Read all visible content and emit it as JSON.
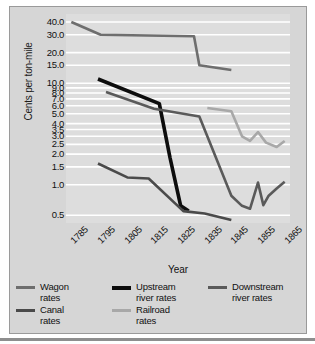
{
  "chart_data": {
    "type": "line",
    "title": "",
    "xlabel": "Year",
    "ylabel": "Cents per ton-mile",
    "yscale": "log",
    "ylim": [
      0.42,
      48
    ],
    "xlim": [
      1783,
      1867
    ],
    "grid": true,
    "grid_color": "#ffffff",
    "background": "#dddddd",
    "legend_position": "below",
    "x_ticks": [
      "1785",
      "1795",
      "1805",
      "1815",
      "1825",
      "1835",
      "1845",
      "1855",
      "1865"
    ],
    "y_ticks": [
      "40.0",
      "30.0",
      "20.0",
      "15.0",
      "10.0",
      "9.0",
      "8.0",
      "7.0",
      "6.0",
      "5.0",
      "4.0",
      "3.5",
      "3.0",
      "2.5",
      "2.0",
      "1.5",
      "1.0",
      "0.5"
    ],
    "y_tick_values": [
      40,
      30,
      20,
      15,
      10,
      9,
      8,
      7,
      6,
      5,
      4,
      3.5,
      3,
      2.5,
      2,
      1.5,
      1,
      0.5
    ],
    "series": [
      {
        "name": "Wagon rates",
        "color": "#6e6e6e",
        "width": 2.6,
        "x": [
          1785,
          1796,
          1831,
          1833,
          1845
        ],
        "values": [
          40.0,
          30.0,
          29.0,
          15.0,
          13.5
        ]
      },
      {
        "name": "Upstream river rates",
        "color": "#0d0d0d",
        "width": 3.6,
        "x": [
          1795,
          1818,
          1822,
          1826,
          1829
        ],
        "values": [
          11.0,
          6.3,
          1.85,
          0.62,
          0.55
        ]
      },
      {
        "name": "Downstream river rates",
        "color": "#5a5a5a",
        "width": 2.6,
        "x": [
          1798,
          1816,
          1833,
          1845,
          1849,
          1852,
          1855,
          1857,
          1859,
          1862,
          1865
        ],
        "values": [
          8.2,
          5.6,
          4.7,
          0.78,
          0.62,
          0.58,
          1.05,
          0.63,
          0.78,
          0.92,
          1.07
        ]
      },
      {
        "name": "Canal rates",
        "color": "#4a4a4a",
        "width": 2.6,
        "x": [
          1795,
          1806,
          1814,
          1827,
          1835,
          1845
        ],
        "values": [
          1.62,
          1.18,
          1.15,
          0.55,
          0.52,
          0.45
        ]
      },
      {
        "name": "Railroad rates",
        "color": "#a8a8a8",
        "width": 2.6,
        "x": [
          1836,
          1845,
          1849,
          1852,
          1855,
          1858,
          1862,
          1865
        ],
        "values": [
          5.7,
          5.3,
          3.0,
          2.7,
          3.3,
          2.6,
          2.35,
          2.7
        ]
      }
    ]
  },
  "legend": {
    "items": [
      {
        "label_line1": "Wagon",
        "label_line2": "rates",
        "color": "#6e6e6e",
        "thick": false
      },
      {
        "label_line1": "Upstream",
        "label_line2": "river rates",
        "color": "#0d0d0d",
        "thick": true
      },
      {
        "label_line1": "Downstream",
        "label_line2": "river rates",
        "color": "#5a5a5a",
        "thick": false
      },
      {
        "label_line1": "Canal",
        "label_line2": "rates",
        "color": "#4a4a4a",
        "thick": false
      },
      {
        "label_line1": "Railroad",
        "label_line2": "rates",
        "color": "#a8a8a8",
        "thick": false
      }
    ]
  }
}
